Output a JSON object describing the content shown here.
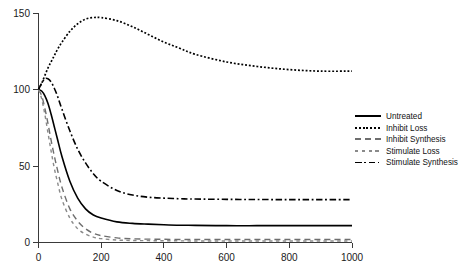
{
  "chart_data": {
    "type": "line",
    "title": "",
    "subtitle": "",
    "xlabel": "",
    "ylabel": "",
    "xlim": [
      0,
      1000
    ],
    "ylim": [
      0,
      150
    ],
    "xticks": [
      0,
      200,
      400,
      600,
      800,
      1000
    ],
    "yticks": [
      0,
      50,
      100,
      150
    ],
    "xtick_labels": [
      "0",
      "200",
      "400",
      "600",
      "800",
      "1000"
    ],
    "ytick_labels": [
      "0",
      "50",
      "100",
      "150"
    ],
    "grid": false,
    "legend_position": "right",
    "background_color": "#ffffff",
    "axis_color": "#3a3a3a",
    "x": [
      0,
      10,
      20,
      30,
      40,
      50,
      60,
      75,
      100,
      125,
      150,
      175,
      200,
      250,
      300,
      350,
      400,
      450,
      500,
      600,
      700,
      800,
      900,
      1000
    ],
    "series": [
      {
        "name": "Untreated",
        "color": "#000000",
        "style": "solid",
        "values": [
          100,
          99,
          96,
          91,
          84,
          76,
          68,
          56,
          40,
          29,
          22,
          18,
          16,
          13.5,
          12.5,
          12,
          11.6,
          11.3,
          11.2,
          11.0,
          11.0,
          11.0,
          11.0,
          11.0
        ]
      },
      {
        "name": "Inhibit Loss",
        "color": "#000000",
        "style": "dotted",
        "values": [
          100,
          104,
          109,
          114,
          118,
          122,
          126,
          131,
          138,
          143,
          146,
          147,
          147,
          145,
          141,
          136,
          131,
          127,
          123,
          118,
          115,
          113,
          112,
          112
        ]
      },
      {
        "name": "Inhibit Synthesis",
        "color": "#6e6e6e",
        "style": "long-dash",
        "values": [
          100,
          96,
          88,
          78,
          67,
          57,
          48,
          36,
          22,
          14,
          9,
          6,
          4.5,
          3,
          2.4,
          2.2,
          2.1,
          2.0,
          2.0,
          2.0,
          2.0,
          2.0,
          2.0,
          2.0
        ]
      },
      {
        "name": "Stimulate Loss",
        "color": "#8a8a8a",
        "style": "short-dash",
        "values": [
          100,
          94,
          84,
          72,
          60,
          49,
          40,
          28,
          16,
          9,
          5.5,
          3.5,
          2.5,
          1.6,
          1.3,
          1.2,
          1.1,
          1.1,
          1.0,
          1.0,
          1.0,
          1.0,
          1.0,
          1.0
        ]
      },
      {
        "name": "Stimulate Synthesis",
        "color": "#000000",
        "style": "dash-dot",
        "values": [
          100,
          104,
          107,
          107,
          105,
          101,
          96,
          87,
          73,
          61,
          52,
          45,
          40,
          34,
          31,
          29.6,
          29,
          28.6,
          28.4,
          28.2,
          28.1,
          28.0,
          28.0,
          28.0
        ]
      }
    ]
  },
  "legend": {
    "entries": [
      {
        "label": "Untreated"
      },
      {
        "label": "Inhibit Loss"
      },
      {
        "label": "Inhibit Synthesis"
      },
      {
        "label": "Stimulate Loss"
      },
      {
        "label": "Stimulate Synthesis"
      }
    ]
  }
}
